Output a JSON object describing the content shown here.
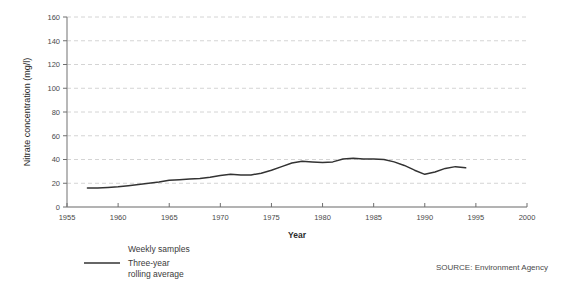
{
  "chart_data": {
    "type": "line",
    "title": "",
    "xlabel": "Year",
    "ylabel": "Nitrate concentration (mg/l)",
    "xlim": [
      1955,
      2000
    ],
    "ylim": [
      0,
      160
    ],
    "xticks": [
      1955,
      1960,
      1965,
      1970,
      1975,
      1980,
      1985,
      1990,
      1995,
      2000
    ],
    "yticks": [
      0,
      20,
      40,
      60,
      80,
      100,
      120,
      140,
      160
    ],
    "grid": "horizontal-dashed",
    "legend_position": "below-left",
    "series": [
      {
        "name": "Weekly samples",
        "style": "points",
        "color": "#333333",
        "x": [],
        "values": []
      },
      {
        "name": "Three-year rolling average",
        "style": "line",
        "color": "#333333",
        "x": [
          1957,
          1958,
          1959,
          1960,
          1961,
          1962,
          1963,
          1964,
          1965,
          1966,
          1967,
          1968,
          1969,
          1970,
          1971,
          1972,
          1973,
          1974,
          1975,
          1976,
          1977,
          1978,
          1979,
          1980,
          1981,
          1982,
          1983,
          1984,
          1985,
          1986,
          1987,
          1988,
          1989,
          1990,
          1991,
          1992,
          1993,
          1994
        ],
        "values": [
          16,
          16,
          16.5,
          17,
          18,
          19,
          20,
          21,
          22.5,
          23,
          23.5,
          24,
          25,
          26.5,
          27.5,
          27,
          27,
          28.5,
          31,
          34,
          37,
          38.5,
          38,
          37.5,
          38,
          40.5,
          41,
          40.5,
          40.5,
          40,
          38,
          35,
          31,
          27.5,
          29.5,
          32.5,
          34,
          33
        ]
      }
    ],
    "legend": [
      {
        "label": "Weekly samples",
        "swatch": "none"
      },
      {
        "label": "Three-year\nrolling average",
        "swatch": "line"
      }
    ],
    "legend_labels": {
      "weekly": "Weekly samples",
      "rolling_line1": "Three-year",
      "rolling_line2": "rolling average"
    },
    "source": "SOURCE: Environment Agency",
    "colors": {
      "line": "#333333",
      "grid": "#c9c9c9",
      "axis": "#8d8d8d",
      "text": "#3a3a3a",
      "background": "#ffffff"
    }
  }
}
